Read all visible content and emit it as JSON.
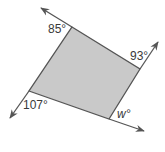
{
  "diagram": {
    "type": "quadrilateral-exterior-angles",
    "fill_color": "#c9c9c9",
    "stroke_color": "#555555",
    "vertices": {
      "top": [
        72,
        27
      ],
      "right": [
        140,
        69
      ],
      "bottom": [
        109,
        119
      ],
      "left": [
        29,
        91
      ]
    },
    "rays": [
      {
        "name": "top-left-ray",
        "from": [
          72,
          27
        ],
        "to": [
          41,
          8
        ]
      },
      {
        "name": "top-right-ray",
        "from": [
          140,
          69
        ],
        "to": [
          158,
          42
        ]
      },
      {
        "name": "bottom-left-ray",
        "from": [
          29,
          91
        ],
        "to": [
          10,
          118
        ]
      },
      {
        "name": "bottom-right-ray",
        "from": [
          109,
          119
        ],
        "to": [
          144,
          131
        ]
      }
    ],
    "labels": {
      "top": "85°",
      "right": "93°",
      "left": "107°",
      "bottom": "w°"
    }
  }
}
